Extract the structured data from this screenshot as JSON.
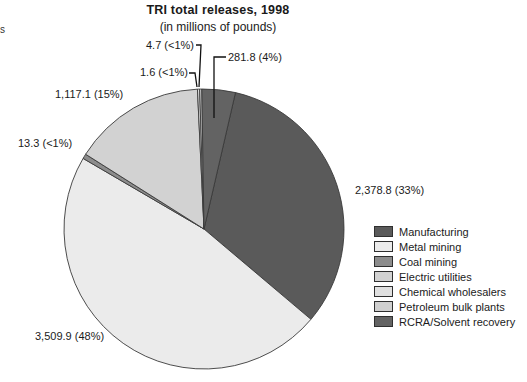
{
  "page": {
    "stray_edge_text": "s"
  },
  "chart_data": {
    "type": "pie",
    "title": "TRI total releases, 1998",
    "subtitle": "(in millions of pounds)",
    "units": "millions of pounds",
    "categories": [
      "Manufacturing",
      "Metal mining",
      "Coal mining",
      "Electric utilities",
      "Chemical wholesalers",
      "Petroleum bulk plants",
      "RCRA/Solvent recovery"
    ],
    "values": [
      2378.8,
      3509.9,
      13.3,
      1117.1,
      1.6,
      4.7,
      281.8
    ],
    "percents": [
      "33%",
      "48%",
      "<1%",
      "15%",
      "<1%",
      "<1%",
      "4%"
    ],
    "slice_labels": [
      "2,378.8 (33%)",
      "3,509.9 (48%)",
      "13.3 (<1%)",
      "1,117.1 (15%)",
      "1.6 (<1%)",
      "4.7 (<1%)",
      "281.8 (4%)"
    ],
    "colors": [
      "#5a5a5a",
      "#ebebeb",
      "#8c8c8c",
      "#d2d2d2",
      "#e0e0e0",
      "#cfcfcf",
      "#636363"
    ],
    "outline_color": "#3a3a3a",
    "leader_color": "#111111",
    "start_angle_deg": 13,
    "legend_position": "right",
    "total": 7307.2
  }
}
